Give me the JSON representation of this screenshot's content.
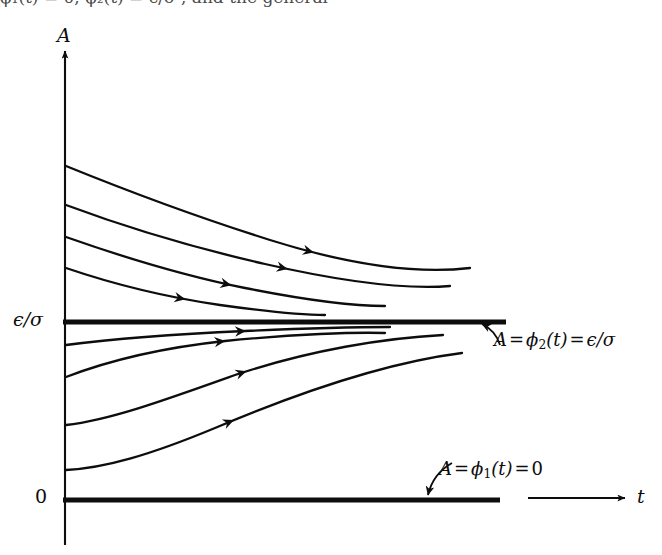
{
  "figure": {
    "kind": "phase-portrait",
    "background_color": "#ffffff",
    "ink_color": "#0d0d0d",
    "axes": {
      "y_axis_label": "A",
      "x_axis_label": "t",
      "y_tick_labels": [
        "ϵ/σ",
        "0"
      ],
      "origin_label": "0"
    },
    "annotations": {
      "upper_equilibrium": {
        "lhs": "A",
        "eq1": "=",
        "phi": "ϕ",
        "phi_sub": "2",
        "arg": "(t)",
        "eq2": "=",
        "rhs": "ϵ/σ",
        "full_text": "A = ϕ2(t) = ϵ/σ"
      },
      "lower_equilibrium": {
        "lhs": "A",
        "eq1": "=",
        "phi": "ϕ",
        "phi_sub": "1",
        "arg": "(t)",
        "eq2": "=",
        "rhs": "0",
        "full_text": "A = ϕ1(t) = 0"
      }
    },
    "top_cropped_text": "ϕ₁(t) = 0,  ϕ₂(t) = ϵ/σ ,  and the general",
    "equilibria": [
      {
        "name": "phi2",
        "value_label": "ϵ/σ",
        "y_px": 322,
        "stability": "stable",
        "x_start": 63,
        "x_end": 506
      },
      {
        "name": "phi1",
        "value_label": "0",
        "y_px": 500,
        "stability": "unstable",
        "x_start": 63,
        "x_end": 500
      }
    ]
  },
  "chart_data": {
    "type": "line",
    "title": "",
    "xlabel": "t",
    "ylabel": "A",
    "grid": false,
    "legend": null,
    "axis_arrows": {
      "y": "up",
      "x": "right"
    },
    "y_axis_px": 65,
    "x_axis_baseline_px": 500,
    "annotations": [
      "A = ϕ2(t) = ϵ/σ",
      "A = ϕ1(t) = 0"
    ],
    "tick_labels": {
      "y": [
        "ϵ/σ",
        "0"
      ]
    },
    "equilibrium_lines": [
      {
        "label": "ϵ/σ",
        "y": 322,
        "stroke_width": 4.5
      },
      {
        "label": "0",
        "y": 500,
        "stroke_width": 4.5
      }
    ],
    "series": [
      {
        "name": "trajectory-above-1",
        "region": "above",
        "path": "M 66,166 C 130,192 200,218 270,240 C 340,262 410,275 470,268",
        "arrow_t": 0.62,
        "end_x": 470
      },
      {
        "name": "trajectory-above-2",
        "region": "above",
        "path": "M 66,205 C 125,227 195,248 265,264 C 335,280 400,290 450,286",
        "arrow_t": 0.58,
        "end_x": 450
      },
      {
        "name": "trajectory-above-3",
        "region": "above",
        "path": "M 66,237 C 120,256 180,275 245,288 C 305,300 350,306 385,306",
        "arrow_t": 0.52,
        "end_x": 385
      },
      {
        "name": "trajectory-above-4",
        "region": "above",
        "path": "M 66,268 C 110,283 165,297 220,305 C 270,312 305,315 325,315",
        "arrow_t": 0.46,
        "end_x": 325
      },
      {
        "name": "trajectory-below-1",
        "region": "below",
        "path": "M 66,345 C 120,338 180,334 245,331 C 310,328 360,327 390,327",
        "arrow_t": 0.55,
        "end_x": 390
      },
      {
        "name": "trajectory-below-2",
        "region": "below",
        "path": "M 66,377 C 105,362 160,348 225,341 C 295,334 355,332 385,333",
        "arrow_t": 0.5,
        "end_x": 385
      },
      {
        "name": "trajectory-below-3",
        "region": "below",
        "path": "M 66,425 C 110,420 165,400 235,375 C 310,350 385,338 443,335",
        "arrow_t": 0.48,
        "end_x": 443
      },
      {
        "name": "trajectory-below-4",
        "region": "below",
        "path": "M 66,470 C 105,468 150,455 215,428 C 300,392 390,362 462,353",
        "arrow_t": 0.42,
        "end_x": 462
      }
    ],
    "pointer_arrows": [
      {
        "name": "pointer-to-phi2-line",
        "from": [
          500,
          345
        ],
        "to": [
          482,
          324
        ]
      },
      {
        "name": "pointer-to-phi1-line",
        "from": [
          452,
          463
        ],
        "to": [
          428,
          495
        ]
      }
    ]
  }
}
